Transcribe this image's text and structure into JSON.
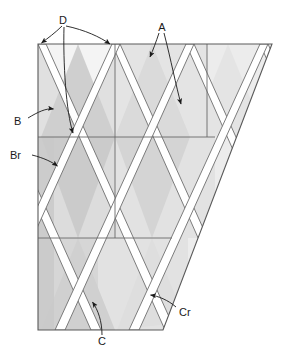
{
  "figure": {
    "shape": "trapezoid with diagonal right edge",
    "background_color": "#ffffff",
    "outline_color": "#5a5a5a",
    "strand_color": "#ffffff",
    "strand_edge_color": "#6b6b6b",
    "arrow_color": "#1a1a1a"
  },
  "geometry": {
    "top_left": [
      38,
      44
    ],
    "top_right": [
      272,
      44
    ],
    "bottom_left": [
      38,
      330
    ],
    "bottom_right": [
      163,
      330
    ],
    "horizontal_guides": [
      137,
      238
    ],
    "vertical_guides": [
      115,
      207
    ],
    "cell_width": 38,
    "cell_height": 93
  },
  "fills": {
    "lightest": "#f2f2f2",
    "light": "#e6e6e6",
    "medium": "#dcdcdc",
    "mid": "#d2d2d2",
    "dark": "#c6c6c6",
    "darkest": "#bdbdbd"
  },
  "labels": [
    {
      "id": "D",
      "text": "D",
      "x": 63,
      "y": 20,
      "anchor": "middle"
    },
    {
      "id": "A",
      "text": "A",
      "x": 162,
      "y": 28,
      "anchor": "middle"
    },
    {
      "id": "B",
      "text": "B",
      "x": 16,
      "y": 122,
      "anchor": "start"
    },
    {
      "id": "Br",
      "text": "Br",
      "x": 12,
      "y": 158,
      "anchor": "start"
    },
    {
      "id": "C",
      "text": "C",
      "x": 102,
      "y": 344,
      "anchor": "middle"
    },
    {
      "id": "Cr",
      "text": "Cr",
      "x": 178,
      "y": 313,
      "anchor": "start"
    }
  ],
  "leader_lines": [
    {
      "for": "D",
      "name": "leader-d-left",
      "path": "M 62 26 C 55 33 48 38 41 44"
    },
    {
      "for": "D",
      "name": "leader-d-right",
      "path": "M 66 26 C 85 30 100 38 111 45"
    },
    {
      "for": "D",
      "name": "leader-d-down",
      "path": "M 64 26 C 64 60 66 110 73 134"
    },
    {
      "for": "A",
      "name": "leader-a-left",
      "path": "M 159 33 C 155 42 152 50 149 58"
    },
    {
      "for": "A",
      "name": "leader-a-right",
      "path": "M 164 33 C 170 60 175 85 182 106"
    },
    {
      "for": "B",
      "name": "leader-b",
      "path": "M 28 118 C 38 112 46 108 54 110"
    },
    {
      "for": "Br",
      "name": "leader-br",
      "path": "M 32 155 C 44 158 52 162 58 167"
    },
    {
      "for": "C",
      "name": "leader-c",
      "path": "M 102 336 C 102 322 98 310 92 301"
    },
    {
      "for": "Cr",
      "name": "leader-cr",
      "path": "M 176 307 C 168 300 158 296 150 295"
    }
  ],
  "callouts": {
    "D": "Crossing node at top edge",
    "A": "Strand in upper field",
    "B": "Band region left side",
    "Br": "Return band left side",
    "C": "Strand at bottom",
    "Cr": "Return strand at bottom right"
  }
}
